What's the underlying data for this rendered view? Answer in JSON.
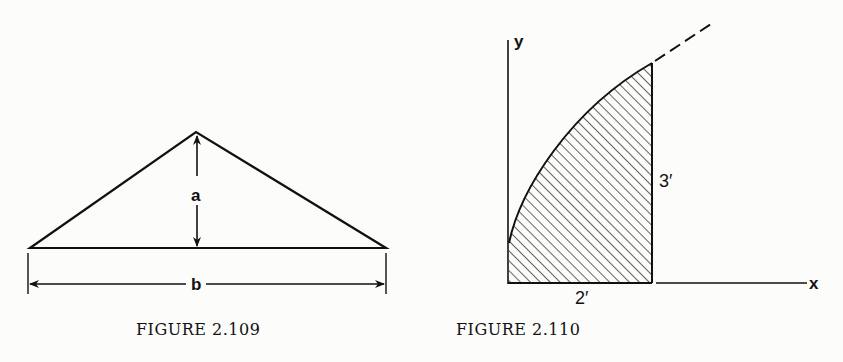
{
  "figure_109": {
    "caption": "FIGURE 2.109",
    "height_label": "a",
    "base_label": "b",
    "shape": "isosceles triangle with height a and base b"
  },
  "figure_110": {
    "caption": "FIGURE 2.110",
    "y_axis_label": "y",
    "x_axis_label": "x",
    "height_label": "3′",
    "width_label": "2′",
    "shape": "shaded region under curve from x=0 to x=2, curve continues dashed"
  },
  "colors": {
    "ink": "#111111",
    "background": "#fcfcfb"
  }
}
